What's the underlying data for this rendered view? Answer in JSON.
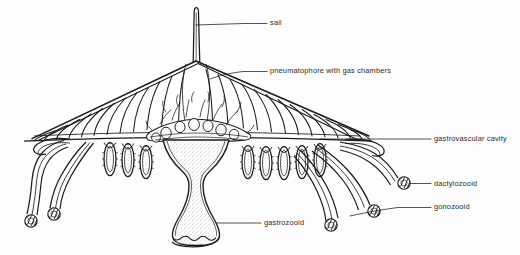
{
  "figure": {
    "organism": "floating siphonophore colony, cutaway side view",
    "style": "black-and-white line drawing, stippled shading",
    "background_color": "#fdfdfd",
    "ink_color": "#1a1a1a"
  },
  "labels": [
    {
      "id": "sail",
      "text": "sail",
      "text_x": 270,
      "text_y": 19,
      "leader": {
        "x1": 244,
        "y1": 23.5,
        "x2": 267,
        "y2": 23.5
      },
      "pointer": {
        "x": 244,
        "y": 23.5,
        "target_x": 196,
        "target_y": 25
      }
    },
    {
      "id": "pneumatophore",
      "text": "pneumatophore with gas chambers",
      "text_x": 270,
      "text_y": 67,
      "leader": {
        "x1": 243,
        "y1": 71.5,
        "x2": 267,
        "y2": 71.5
      },
      "pointer": {
        "x": 243,
        "y": 71.5,
        "target_x": 212,
        "target_y": 78
      }
    },
    {
      "id": "gastrovascular-cavity",
      "text": "gastrovascular cavity",
      "text_x": 434,
      "text_y": 135,
      "leader": {
        "x1": 400,
        "y1": 139,
        "x2": 431,
        "y2": 139
      },
      "pointer": {
        "x": 400,
        "y": 139,
        "target_x": 320,
        "target_y": 139
      }
    },
    {
      "id": "dactylozooid",
      "text": "dactylozooid",
      "text_x": 434,
      "text_y": 180,
      "leader": {
        "x1": 420,
        "y1": 184,
        "x2": 431,
        "y2": 184
      },
      "pointer": {
        "x": 420,
        "y": 184,
        "target_x": 409,
        "target_y": 184
      }
    },
    {
      "id": "gonozooid",
      "text": "gonozooid",
      "text_x": 434,
      "text_y": 203,
      "leader": {
        "x1": 398,
        "y1": 207,
        "x2": 431,
        "y2": 207
      },
      "pointer": {
        "x": 398,
        "y": 207,
        "target_x": 352,
        "target_y": 216
      }
    },
    {
      "id": "gastrozooid",
      "text": "gastrozooid",
      "text_x": 264,
      "text_y": 219,
      "leader": {
        "x1": 233,
        "y1": 223,
        "x2": 261,
        "y2": 223
      },
      "pointer": {
        "x": 233,
        "y": 223,
        "target_x": 214,
        "target_y": 223
      }
    }
  ],
  "structures": {
    "sail": {
      "apex_x": 196,
      "apex_y": 8,
      "base_y": 62,
      "description": "thin erect vertical fin on top of float"
    },
    "float": {
      "apex_x": 196,
      "apex_y": 62,
      "left_tip_x": 24,
      "right_tip_x": 372,
      "base_y": 142,
      "description": "triangular tent-shaped pneumatophore with radial gas chambers"
    },
    "gas_chamber_count": 30,
    "gastrozooid": {
      "center_x": 196,
      "top_y": 140,
      "bottom_y": 244,
      "description": "large central trumpet-shaped feeding polyp with scalloped mouth rim"
    },
    "gonozooid_count": 14,
    "dactylozooid_count": 6,
    "tentacle_tip_note": "knobbed bulbous capitate tips"
  }
}
